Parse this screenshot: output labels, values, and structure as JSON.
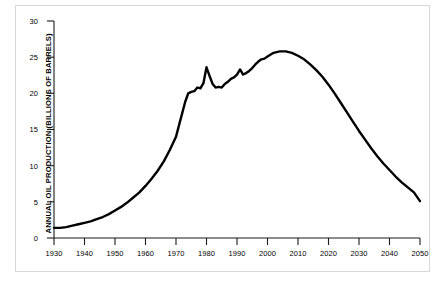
{
  "chart_data": {
    "type": "line",
    "title": "",
    "xlabel": "",
    "ylabel": "ANNUAL OIL PRODUCTION (BILLIONS OF BARRELS)",
    "xlim": [
      1930,
      2050
    ],
    "ylim": [
      0,
      30
    ],
    "xticks": [
      1930,
      1940,
      1950,
      1960,
      1970,
      1980,
      1990,
      2000,
      2010,
      2020,
      2030,
      2040,
      2050
    ],
    "yticks": [
      0,
      5,
      10,
      15,
      20,
      25,
      30
    ],
    "xtick_labels": [
      "1930",
      "1940",
      "1950",
      "1960",
      "1970",
      "1980",
      "1990",
      "2000",
      "2010",
      "2020",
      "2030",
      "2040",
      "2050"
    ],
    "ytick_labels": [
      "0",
      "5",
      "10",
      "15",
      "20",
      "25",
      "30"
    ],
    "grid": false,
    "legend": null,
    "line_color": "#000000",
    "line_width": 2.4,
    "series": [
      {
        "name": "Annual oil production",
        "x": [
          1930,
          1932,
          1934,
          1936,
          1938,
          1940,
          1942,
          1944,
          1946,
          1948,
          1950,
          1952,
          1954,
          1956,
          1958,
          1960,
          1962,
          1964,
          1966,
          1968,
          1970,
          1971,
          1972,
          1973,
          1974,
          1975,
          1976,
          1977,
          1978,
          1979,
          1980,
          1981,
          1982,
          1983,
          1984,
          1985,
          1986,
          1987,
          1988,
          1989,
          1990,
          1991,
          1992,
          1993,
          1994,
          1995,
          1996,
          1997,
          1998,
          1999,
          2000,
          2002,
          2004,
          2006,
          2008,
          2010,
          2012,
          2014,
          2016,
          2018,
          2020,
          2022,
          2024,
          2026,
          2028,
          2030,
          2032,
          2034,
          2036,
          2038,
          2040,
          2042,
          2044,
          2046,
          2048,
          2050
        ],
        "y": [
          1.4,
          1.4,
          1.5,
          1.7,
          1.9,
          2.1,
          2.3,
          2.6,
          2.9,
          3.3,
          3.8,
          4.3,
          4.9,
          5.6,
          6.3,
          7.2,
          8.2,
          9.3,
          10.6,
          12.2,
          14.0,
          15.6,
          17.2,
          18.8,
          20.0,
          20.2,
          20.3,
          20.8,
          20.7,
          21.4,
          23.6,
          22.4,
          21.3,
          20.8,
          20.9,
          20.8,
          21.3,
          21.6,
          22.0,
          22.2,
          22.6,
          23.3,
          22.6,
          22.8,
          23.1,
          23.5,
          24.0,
          24.4,
          24.7,
          24.8,
          25.1,
          25.6,
          25.8,
          25.8,
          25.6,
          25.2,
          24.7,
          24.0,
          23.2,
          22.3,
          21.2,
          20.0,
          18.7,
          17.4,
          16.1,
          14.8,
          13.6,
          12.4,
          11.3,
          10.3,
          9.4,
          8.5,
          7.7,
          7.0,
          6.3,
          5.1
        ]
      }
    ]
  },
  "axes": {
    "ylabel_text": "ANNUAL OIL PRODUCTION (BILLIONS OF BARRELS)"
  }
}
